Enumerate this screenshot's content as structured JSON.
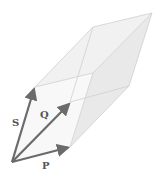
{
  "diagram": {
    "type": "parallelepiped-vectors",
    "colors": {
      "vector": "#6b6b6b",
      "edge": "#cfcfcf",
      "face_light": "#f4f4f4",
      "face_mid": "#ebebeb",
      "label": "#555555"
    },
    "vertices": {
      "O": [
        12,
        162
      ],
      "P": [
        70,
        147
      ],
      "S": [
        35,
        87
      ],
      "SP": [
        93,
        73
      ],
      "D": [
        70,
        102
      ],
      "PD": [
        129,
        86
      ],
      "SD": [
        93,
        27
      ],
      "SPD": [
        152,
        13
      ]
    },
    "vectors": [
      {
        "name": "P",
        "label": "P",
        "from": "O",
        "to": "P",
        "label_pos": [
          42,
          169
        ]
      },
      {
        "name": "Q",
        "label": "Q",
        "from": "O",
        "to": "D",
        "label_pos": [
          40,
          118
        ]
      },
      {
        "name": "S",
        "label": "S",
        "from": "O",
        "to": "S",
        "label_pos": [
          12,
          126
        ]
      }
    ]
  }
}
